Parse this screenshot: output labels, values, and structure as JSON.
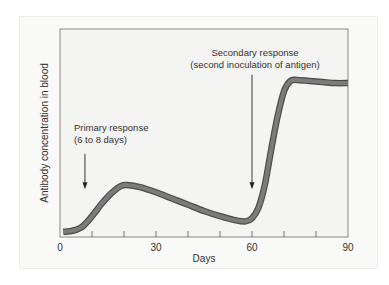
{
  "chart_data": {
    "type": "line",
    "title": "",
    "xlabel": "Days",
    "ylabel": "Antibody concentration in blood",
    "xlim": [
      0,
      90
    ],
    "ylim": [
      0,
      100
    ],
    "x_ticks": [
      0,
      10,
      20,
      30,
      40,
      50,
      60,
      70,
      80,
      90
    ],
    "x_tick_labels": [
      {
        "value": 0,
        "label": "0"
      },
      {
        "value": 30,
        "label": "30"
      },
      {
        "value": 60,
        "label": "60"
      },
      {
        "value": 90,
        "label": "90"
      }
    ],
    "y_ticks": [],
    "grid": false,
    "legend": "none",
    "series": [
      {
        "name": "Antibody concentration",
        "x": [
          1,
          4,
          7,
          10,
          13,
          16,
          19,
          21,
          25,
          30,
          35,
          40,
          45,
          50,
          55,
          58,
          60,
          62,
          64,
          66,
          68,
          70,
          72,
          74,
          78,
          82,
          86,
          90
        ],
        "y": [
          2.5,
          3,
          5,
          10,
          16,
          21,
          24.5,
          25,
          24,
          21.5,
          18.5,
          15.5,
          12.5,
          10,
          8,
          7.5,
          9,
          14,
          25,
          42,
          58,
          70,
          75,
          75.5,
          75,
          74.5,
          74,
          74
        ]
      }
    ],
    "annotations": [
      {
        "id": "primary",
        "lines": [
          "Primary response",
          "(6 to 8 days)"
        ],
        "arrow_x": 7.8,
        "arrow_from_y": 40,
        "arrow_to_y": 23
      },
      {
        "id": "secondary",
        "lines": [
          "Secondary response",
          "(second inoculation of antigen)"
        ],
        "arrow_x": 60,
        "arrow_from_y": 78,
        "arrow_to_y": 23
      }
    ],
    "colors": {
      "curve_fill": "#7b7b7b",
      "curve_outline": "#4a4a4a",
      "axis": "#8a8a8a",
      "arrow": "#222222",
      "plot_bg": "#f4f4f2"
    }
  }
}
